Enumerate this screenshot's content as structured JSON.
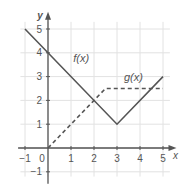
{
  "chart_data": {
    "type": "line",
    "title": "",
    "xlabel": "x",
    "ylabel": "y",
    "xlim": [
      -1.3,
      5.5
    ],
    "ylim": [
      -1.5,
      5.6
    ],
    "grid": true,
    "x_ticks": [
      -1,
      0,
      1,
      2,
      3,
      4,
      5
    ],
    "y_ticks": [
      -1,
      1,
      2,
      3,
      4,
      5
    ],
    "series": [
      {
        "name": "f(x)",
        "style": "solid",
        "color": "#555555",
        "points": [
          [
            -1,
            5
          ],
          [
            3,
            1
          ],
          [
            5,
            3
          ]
        ],
        "label_pos": [
          1.1,
          3.6
        ]
      },
      {
        "name": "g(x)",
        "style": "dashed",
        "color": "#555555",
        "points": [
          [
            0,
            0
          ],
          [
            2.5,
            2.5
          ],
          [
            5,
            2.5
          ]
        ],
        "label_pos": [
          3.3,
          2.8
        ]
      }
    ]
  }
}
